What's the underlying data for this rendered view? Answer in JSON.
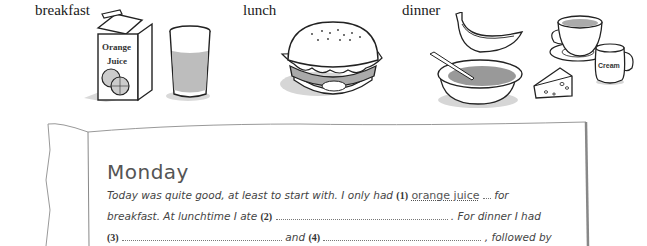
{
  "labels": {
    "breakfast": "breakfast",
    "lunch": "lunch",
    "dinner": "dinner"
  },
  "illustrations": {
    "breakfast": [
      "orange-juice-carton",
      "glass-of-juice"
    ],
    "carton_text_line1": "Orange",
    "carton_text_line2": "Juice",
    "lunch": [
      "hamburger"
    ],
    "dinner": [
      "banana",
      "bowl-of-soup",
      "cheese-wedge",
      "cup-of-tea",
      "cream-jug"
    ],
    "jug_text": "Cream"
  },
  "diary": {
    "title": "Monday",
    "line1_before": "Today was quite good, at least to start with. I only had",
    "blank1_num": "(1)",
    "blank1_answer": "orange juice",
    "line1_after": "for",
    "line2_before": "breakfast. At lunchtime I ate",
    "blank2_num": "(2)",
    "line2_after": ". For dinner I had",
    "blank3_num": "(3)",
    "line3_mid": "and",
    "blank4_num": "(4)",
    "line3_after": ", followed by"
  }
}
